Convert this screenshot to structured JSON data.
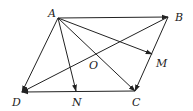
{
  "diagram": {
    "type": "parallelogram-vectors",
    "points": {
      "A": {
        "x": 58,
        "y": 18,
        "label": "A",
        "lx": 48,
        "ly": 17
      },
      "B": {
        "x": 168,
        "y": 17,
        "label": "B",
        "lx": 175,
        "ly": 21
      },
      "C": {
        "x": 135,
        "y": 91,
        "label": "C",
        "lx": 132,
        "ly": 106
      },
      "D": {
        "x": 22,
        "y": 92,
        "label": "D",
        "lx": 12,
        "ly": 106
      },
      "N": {
        "x": 76,
        "y": 91,
        "label": "N",
        "lx": 72,
        "ly": 106
      },
      "M": {
        "x": 152,
        "y": 54,
        "label": "M",
        "lx": 156,
        "ly": 67
      },
      "O": {
        "x": 95,
        "y": 55,
        "label": "O",
        "lx": 89,
        "ly": 69
      }
    },
    "vectors": [
      {
        "from": "A",
        "to": "B"
      },
      {
        "from": "A",
        "to": "M"
      },
      {
        "from": "A",
        "to": "C"
      },
      {
        "from": "A",
        "to": "N"
      },
      {
        "from": "A",
        "to": "D"
      },
      {
        "from": "B",
        "to": "D"
      },
      {
        "from": "B",
        "to": "C"
      },
      {
        "from": "C",
        "to": "D"
      }
    ],
    "stroke_color": "#222222"
  }
}
